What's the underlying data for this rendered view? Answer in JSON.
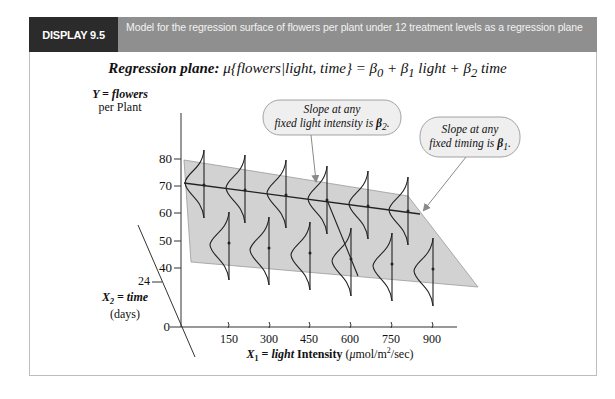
{
  "header": {
    "tab_label": "DISPLAY 9.5",
    "caption": "Model for the regression surface of flowers per plant under 12 treatment levels as a regression plane"
  },
  "equation": {
    "label": "Regression plane:",
    "formula": "μ{flowers|light, time} = β0 + β1 light + β2 time"
  },
  "y_axis": {
    "title_line1": "Y = flowers",
    "title_line2": "per Plant",
    "ticks": [
      "80",
      "70",
      "60",
      "50",
      "40",
      "0"
    ]
  },
  "x2_axis": {
    "tick": "24",
    "title_line1": "X2 = time",
    "title_line2": "(days)"
  },
  "x1_axis": {
    "ticks": [
      "150",
      "300",
      "450",
      "600",
      "750",
      "900"
    ],
    "title": "X1 = light Intensity (μmol/m²/sec)"
  },
  "callouts": [
    {
      "line1": "Slope at any",
      "line2": "fixed light intensity is β2."
    },
    {
      "line1": "Slope at any",
      "line2": "fixed timing is β1."
    }
  ],
  "colors": {
    "plane_fill": "#d2d2d2",
    "header_dark": "#2b2b2b",
    "header_band": "#8f8f8f",
    "callout_fill": "#efefef"
  }
}
